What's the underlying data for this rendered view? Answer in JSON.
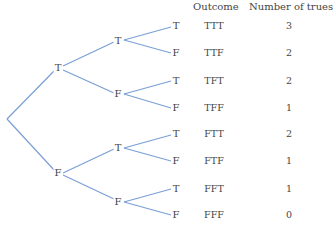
{
  "colors": {
    "branch": "#7a9fd6",
    "text": "#444444"
  },
  "table": {
    "headers": {
      "outcome": "Outcome",
      "count": "Number of trues"
    },
    "rows": [
      {
        "outcome": "TTT",
        "count": "3"
      },
      {
        "outcome": "TTF",
        "count": "2"
      },
      {
        "outcome": "TFT",
        "count": "2"
      },
      {
        "outcome": "TFF",
        "count": "1"
      },
      {
        "outcome": "FTT",
        "count": "2"
      },
      {
        "outcome": "FTF",
        "count": "1"
      },
      {
        "outcome": "FFT",
        "count": "1"
      },
      {
        "outcome": "FFF",
        "count": "0"
      }
    ]
  },
  "tree": {
    "level1": [
      "T",
      "F"
    ],
    "level2": [
      "T",
      "F",
      "T",
      "F"
    ],
    "level3": [
      "T",
      "F",
      "T",
      "F",
      "T",
      "F",
      "T",
      "F"
    ]
  }
}
